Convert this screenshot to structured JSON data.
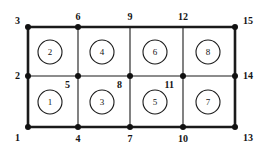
{
  "figure": {
    "type": "finite-element-mesh-diagram",
    "width": 261,
    "height": 153,
    "background_color": "#ffffff",
    "line_color": "#1a1a1a",
    "node_marker_color": "#111111",
    "text_color": "#141414"
  },
  "geometry": {
    "column_x": [
      28,
      78,
      130,
      183,
      235
    ],
    "row_y": [
      127,
      76,
      27
    ],
    "outer_border_width": 2.6,
    "inner_line_width": 1.1,
    "node_dot_radius": 3.0,
    "element_circle_radius": 12.0
  },
  "nodes": [
    {
      "id": "1",
      "label": "1",
      "x": 28,
      "y": 127,
      "dot": true,
      "label_x": 20,
      "label_y": 133,
      "anchor": "right-top"
    },
    {
      "id": "2",
      "label": "2",
      "x": 28,
      "y": 76,
      "dot": true,
      "label_x": 20,
      "label_y": 71,
      "anchor": "right-middle"
    },
    {
      "id": "3",
      "label": "3",
      "x": 28,
      "y": 27,
      "dot": true,
      "label_x": 20,
      "label_y": 16,
      "anchor": "right-bottom"
    },
    {
      "id": "4",
      "label": "4",
      "x": 78,
      "y": 127,
      "dot": true,
      "label_x": 78,
      "label_y": 134,
      "anchor": "center-top"
    },
    {
      "id": "5",
      "label": "5",
      "x": 78,
      "y": 76,
      "dot": true,
      "label_x": 70,
      "label_y": 80,
      "anchor": "inside-right"
    },
    {
      "id": "6",
      "label": "6",
      "x": 78,
      "y": 27,
      "dot": true,
      "label_x": 78,
      "label_y": 12,
      "anchor": "center-bottom"
    },
    {
      "id": "7",
      "label": "7",
      "x": 130,
      "y": 127,
      "dot": true,
      "label_x": 130,
      "label_y": 134,
      "anchor": "center-top"
    },
    {
      "id": "8",
      "label": "8",
      "x": 130,
      "y": 76,
      "dot": true,
      "label_x": 122,
      "label_y": 80,
      "anchor": "inside-right"
    },
    {
      "id": "9",
      "label": "9",
      "x": 130,
      "y": 27,
      "dot": false,
      "label_x": 130,
      "label_y": 12,
      "anchor": "center-bottom"
    },
    {
      "id": "10",
      "label": "10",
      "x": 183,
      "y": 127,
      "dot": true,
      "label_x": 183,
      "label_y": 134,
      "anchor": "center-top"
    },
    {
      "id": "11",
      "label": "11",
      "x": 183,
      "y": 76,
      "dot": true,
      "label_x": 174,
      "label_y": 80,
      "anchor": "inside-right"
    },
    {
      "id": "12",
      "label": "12",
      "x": 183,
      "y": 27,
      "dot": false,
      "label_x": 183,
      "label_y": 12,
      "anchor": "center-bottom"
    },
    {
      "id": "13",
      "label": "13",
      "x": 235,
      "y": 127,
      "dot": true,
      "label_x": 243,
      "label_y": 133,
      "anchor": "left-top"
    },
    {
      "id": "14",
      "label": "14",
      "x": 235,
      "y": 76,
      "dot": true,
      "label_x": 243,
      "label_y": 71,
      "anchor": "left-middle"
    },
    {
      "id": "15",
      "label": "15",
      "x": 235,
      "y": 27,
      "dot": true,
      "label_x": 243,
      "label_y": 16,
      "anchor": "left-bottom"
    }
  ],
  "elements": [
    {
      "id": "1",
      "label": "1",
      "cx": 50,
      "cy": 102,
      "row": "bottom",
      "column": 1
    },
    {
      "id": "2",
      "label": "2",
      "cx": 50,
      "cy": 52,
      "row": "top",
      "column": 1
    },
    {
      "id": "3",
      "label": "3",
      "cx": 102,
      "cy": 102,
      "row": "bottom",
      "column": 2
    },
    {
      "id": "4",
      "label": "4",
      "cx": 102,
      "cy": 52,
      "row": "top",
      "column": 2
    },
    {
      "id": "5",
      "label": "5",
      "cx": 155,
      "cy": 102,
      "row": "bottom",
      "column": 3
    },
    {
      "id": "6",
      "label": "6",
      "cx": 155,
      "cy": 52,
      "row": "top",
      "column": 3
    },
    {
      "id": "7",
      "label": "7",
      "cx": 208,
      "cy": 102,
      "row": "bottom",
      "column": 4
    },
    {
      "id": "8",
      "label": "8",
      "cx": 208,
      "cy": 52,
      "row": "top",
      "column": 4
    }
  ],
  "edges": {
    "outer": [
      {
        "name": "left-border",
        "x1": 28,
        "y1": 27,
        "x2": 28,
        "y2": 127
      },
      {
        "name": "right-border",
        "x1": 235,
        "y1": 27,
        "x2": 235,
        "y2": 127
      },
      {
        "name": "top-border",
        "x1": 28,
        "y1": 27,
        "x2": 235,
        "y2": 27
      },
      {
        "name": "bottom-border",
        "x1": 28,
        "y1": 127,
        "x2": 235,
        "y2": 127
      }
    ],
    "inner": [
      {
        "name": "horizontal-mid",
        "x1": 28,
        "y1": 76,
        "x2": 235,
        "y2": 76
      },
      {
        "name": "vertical-4-6",
        "x1": 78,
        "y1": 27,
        "x2": 78,
        "y2": 127
      },
      {
        "name": "vertical-7-9",
        "x1": 130,
        "y1": 27,
        "x2": 130,
        "y2": 127
      },
      {
        "name": "vertical-10-12",
        "x1": 183,
        "y1": 27,
        "x2": 183,
        "y2": 127
      }
    ]
  }
}
